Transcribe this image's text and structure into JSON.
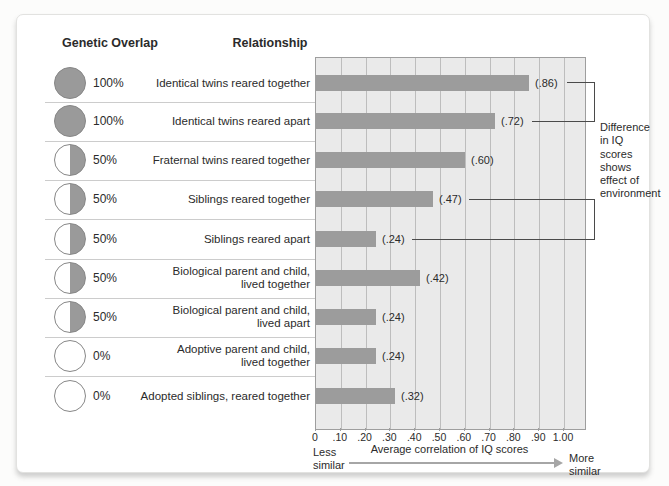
{
  "headers": {
    "genetic_overlap": "Genetic Overlap",
    "relationship": "Relationship"
  },
  "rows": [
    {
      "overlap_pct": "100%",
      "overlap_type": "full",
      "relationship": "Identical twins reared together",
      "value": 0.86,
      "value_label": "(.86)"
    },
    {
      "overlap_pct": "100%",
      "overlap_type": "full",
      "relationship": "Identical twins reared apart",
      "value": 0.72,
      "value_label": "(.72)"
    },
    {
      "overlap_pct": "50%",
      "overlap_type": "half",
      "relationship": "Fraternal twins reared together",
      "value": 0.6,
      "value_label": "(.60)"
    },
    {
      "overlap_pct": "50%",
      "overlap_type": "half",
      "relationship": "Siblings reared together",
      "value": 0.47,
      "value_label": "(.47)"
    },
    {
      "overlap_pct": "50%",
      "overlap_type": "half",
      "relationship": "Siblings reared apart",
      "value": 0.24,
      "value_label": "(.24)"
    },
    {
      "overlap_pct": "50%",
      "overlap_type": "half",
      "relationship": "Biological parent and child,\nlived together",
      "value": 0.42,
      "value_label": "(.42)"
    },
    {
      "overlap_pct": "50%",
      "overlap_type": "half",
      "relationship": "Biological parent and child,\nlived apart",
      "value": 0.24,
      "value_label": "(.24)"
    },
    {
      "overlap_pct": "0%",
      "overlap_type": "empty",
      "relationship": "Adoptive parent and child,\nlived together",
      "value": 0.24,
      "value_label": "(.24)"
    },
    {
      "overlap_pct": "0%",
      "overlap_type": "empty",
      "relationship": "Adopted siblings, reared together",
      "value": 0.32,
      "value_label": "(.32)"
    }
  ],
  "axis": {
    "ticks": [
      "0",
      ".10",
      ".20",
      ".30",
      ".40",
      ".50",
      ".60",
      ".70",
      ".80",
      ".90",
      "1.00"
    ],
    "tick_values": [
      0,
      0.1,
      0.2,
      0.3,
      0.4,
      0.5,
      0.6,
      0.7,
      0.8,
      0.9,
      1.0
    ],
    "caption": "Average correlation of IQ scores",
    "left_label": "Less\nsimilar",
    "right_label": "More\nsimilar"
  },
  "annotation": {
    "text_lines": "Difference\nin IQ\nscores\nshows\neffect of\nenvironment"
  },
  "colors": {
    "bar": "#9c9c9c",
    "circle_fill": "#9a9a9a",
    "plot_bg": "#eaeaea",
    "gridline": "#bdbdbd",
    "plot_border": "#9e9e9e",
    "arrow": "#a6a6a6"
  },
  "chart_data": {
    "type": "bar",
    "orientation": "horizontal",
    "categories": [
      "Identical twins reared together",
      "Identical twins reared apart",
      "Fraternal twins reared together",
      "Siblings reared together",
      "Siblings reared apart",
      "Biological parent and child, lived together",
      "Biological parent and child, lived apart",
      "Adoptive parent and child, lived together",
      "Adopted siblings, reared together"
    ],
    "values": [
      0.86,
      0.72,
      0.6,
      0.47,
      0.24,
      0.42,
      0.24,
      0.24,
      0.32
    ],
    "genetic_overlap": [
      "100%",
      "100%",
      "50%",
      "50%",
      "50%",
      "50%",
      "50%",
      "0%",
      "0%"
    ],
    "xlabel": "Average correlation of IQ scores",
    "xlim": [
      0,
      1.0
    ],
    "grid": true,
    "legend": false,
    "annotations": [
      {
        "text": "Difference in IQ scores shows effect of environment",
        "links_rows": [
          [
            0,
            1
          ],
          [
            3,
            4
          ]
        ]
      }
    ]
  }
}
